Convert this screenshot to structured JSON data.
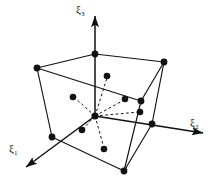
{
  "figure": {
    "type": "3d-geometry-diagram",
    "background_color": "#ffffff",
    "stroke_color": "#111111",
    "node_color": "#111111"
  },
  "axes": {
    "origin_label": "",
    "items": [
      {
        "id": "xi1",
        "label": "ξ",
        "sub": "1",
        "direction": "lower-left",
        "from": [
          95,
          116
        ],
        "to": [
          22,
          171
        ],
        "label_pos": [
          9,
          143
        ]
      },
      {
        "id": "xi2",
        "label": "ξ",
        "sub": "2",
        "direction": "right-down",
        "from": [
          95,
          116
        ],
        "to": [
          207,
          133
        ],
        "label_pos": [
          190,
          117
        ]
      },
      {
        "id": "xi3",
        "label": "ξ",
        "sub": "3",
        "direction": "up",
        "from": [
          95,
          116
        ],
        "to": [
          95,
          12
        ],
        "label_pos": [
          76,
          4
        ]
      }
    ]
  },
  "cube": {
    "name": "hexahedron",
    "vertices": [
      {
        "id": "v-top-back-left",
        "x": 37,
        "y": 68,
        "visible": true
      },
      {
        "id": "v-top-back-right",
        "x": 164,
        "y": 62,
        "visible": true
      },
      {
        "id": "v-top-front-left",
        "x": 95,
        "y": 54,
        "visible": true
      },
      {
        "id": "v-top-front-right",
        "x": 141,
        "y": 101,
        "visible": true
      },
      {
        "id": "v-bot-back-left",
        "x": 52,
        "y": 137,
        "visible": true
      },
      {
        "id": "v-bot-back-right",
        "x": 152,
        "y": 124,
        "visible": true
      },
      {
        "id": "v-bot-front",
        "x": 124,
        "y": 171,
        "visible": true
      },
      {
        "id": "v-bot-hidden",
        "x": 95,
        "y": 116,
        "visible": false
      }
    ],
    "edges": [
      [
        "v-top-back-left",
        "v-top-front-left"
      ],
      [
        "v-top-front-left",
        "v-top-back-right"
      ],
      [
        "v-top-back-right",
        "v-top-front-right"
      ],
      [
        "v-top-front-right",
        "v-top-back-left"
      ],
      [
        "v-top-back-left",
        "v-bot-back-left"
      ],
      [
        "v-top-back-right",
        "v-bot-back-right"
      ],
      [
        "v-top-front-right",
        "v-bot-front"
      ],
      [
        "v-bot-back-left",
        "v-bot-front"
      ],
      [
        "v-bot-front",
        "v-bot-back-right"
      ]
    ]
  },
  "interior": {
    "center": {
      "id": "node-center",
      "x": 95,
      "y": 116
    },
    "nodes": [
      {
        "id": "node-plus-xi3",
        "x": 107,
        "y": 76,
        "dashed_from_center": true
      },
      {
        "id": "node-minus-xi3",
        "x": 104,
        "y": 149,
        "dashed_from_center": true
      },
      {
        "id": "node-minus-xi2",
        "x": 73,
        "y": 97,
        "dashed_from_center": true
      },
      {
        "id": "node-plus-xi2",
        "x": 140,
        "y": 112,
        "dashed_from_center": true
      },
      {
        "id": "node-plus-xi1",
        "x": 82,
        "y": 130,
        "dashed_from_center": true
      },
      {
        "id": "node-minus-xi1",
        "x": 125,
        "y": 99,
        "dashed_from_center": true
      }
    ]
  }
}
